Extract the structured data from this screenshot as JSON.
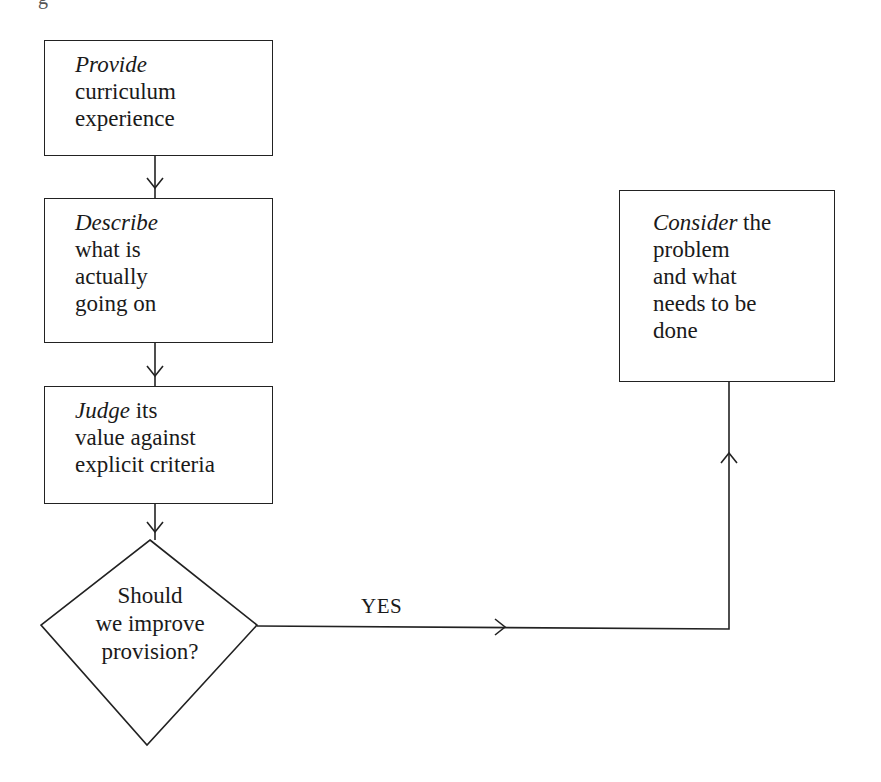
{
  "figure": {
    "caption_fragment": "g"
  },
  "nodes": {
    "provide": {
      "verb": "Provide",
      "lines": [
        "curriculum",
        "experience"
      ]
    },
    "describe": {
      "verb": "Describe",
      "lines": [
        "what is",
        "actually",
        "going on"
      ]
    },
    "judge": {
      "verb": "Judge",
      "first_rest": " its",
      "lines": [
        "value against",
        "explicit criteria"
      ]
    },
    "decision": {
      "lines": [
        "Should",
        "we improve",
        "provision?"
      ]
    },
    "consider": {
      "verb": "Consider",
      "first_rest": " the",
      "lines": [
        "problem",
        "and what",
        "needs to be",
        "done"
      ]
    }
  },
  "edges": {
    "yes_label": "YES"
  }
}
